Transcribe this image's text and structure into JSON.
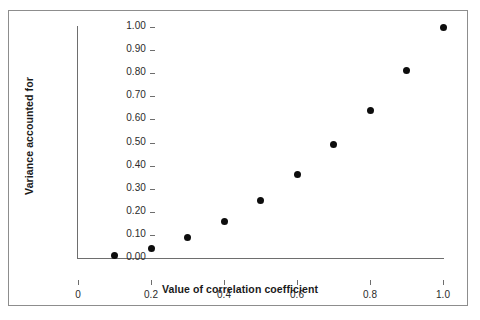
{
  "chart_data": {
    "type": "scatter",
    "title": "",
    "xlabel": "Value of correlation coefficient",
    "ylabel": "Variance accounted for",
    "x": [
      0.1,
      0.2,
      0.3,
      0.4,
      0.5,
      0.6,
      0.7,
      0.8,
      0.9,
      1.0
    ],
    "values": [
      0.01,
      0.04,
      0.09,
      0.16,
      0.25,
      0.36,
      0.49,
      0.64,
      0.81,
      1.0
    ],
    "xlim": [
      0.0,
      1.0
    ],
    "ylim": [
      0.0,
      1.0
    ],
    "xticks": [
      0,
      0.2,
      0.4,
      0.6,
      0.8,
      1.0
    ],
    "xtick_labels": [
      "0",
      "0.2",
      "0.4",
      "0.6",
      "0.8",
      "1.0"
    ],
    "yticks": [
      0.0,
      0.1,
      0.2,
      0.3,
      0.4,
      0.5,
      0.6,
      0.7,
      0.8,
      0.9,
      1.0
    ],
    "ytick_labels": [
      "0.00",
      "0.10",
      "0.20",
      "0.30",
      "0.40",
      "0.50",
      "0.60",
      "0.70",
      "0.80",
      "0.90",
      "1.00"
    ],
    "grid": false,
    "legend": false,
    "marker_color": "#0d0d0d",
    "axis_color": "#6e6e6e"
  }
}
